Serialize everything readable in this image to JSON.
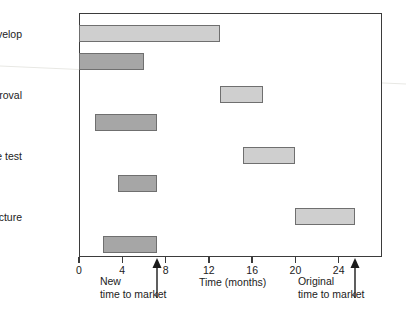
{
  "chart_data": {
    "type": "bar",
    "orientation": "horizontal",
    "title": "",
    "xlabel": "Time (months)",
    "ylabel": "",
    "xlim": [
      0,
      28
    ],
    "ylim": [
      0,
      4
    ],
    "grid": false,
    "legend": null,
    "xticks": [
      0,
      4,
      8,
      12,
      16,
      20,
      24
    ],
    "xtick_labels": [
      "0",
      "4",
      "8",
      "12",
      "16",
      "20",
      "24"
    ],
    "categories": [
      "Develop",
      "Approval",
      "Site test",
      "Manufacture"
    ],
    "series": [
      {
        "name": "Original schedule",
        "style": "light",
        "color": "#cfcfcf",
        "edge_color": "#6f6f6f",
        "spans": [
          {
            "category": "Develop",
            "start": 0.0,
            "end": 13.0
          },
          {
            "category": "Approval",
            "start": 13.0,
            "end": 17.0
          },
          {
            "category": "Site test",
            "start": 15.2,
            "end": 20.0
          },
          {
            "category": "Manufacture",
            "start": 20.0,
            "end": 25.5
          }
        ]
      },
      {
        "name": "New concurrent schedule",
        "style": "dark",
        "color": "#a6a6a6",
        "edge_color": "#6f6f6f",
        "spans": [
          {
            "category": "Develop",
            "start": 0.0,
            "end": 6.0
          },
          {
            "category": "Approval",
            "start": 1.5,
            "end": 7.2
          },
          {
            "category": "Site test",
            "start": 3.6,
            "end": 7.2
          },
          {
            "category": "Manufacture",
            "start": 2.2,
            "end": 7.2
          }
        ]
      }
    ],
    "annotations": [
      {
        "id": "new-time-to-market",
        "x": 7.2,
        "line1": "New",
        "line2": "time to market",
        "marker": "up-arrow"
      },
      {
        "id": "original-time-to-market",
        "x": 25.5,
        "line1": "Original",
        "line2": "time to market",
        "marker": "up-arrow"
      }
    ]
  },
  "axis": {
    "x_title": "Time (months)"
  },
  "colors": {
    "frame": "#3b3b3b",
    "light_bar": "#cfcfcf",
    "dark_bar": "#a6a6a6",
    "bar_edge": "#6f6f6f",
    "text": "#222222",
    "background": "#ffffff"
  }
}
